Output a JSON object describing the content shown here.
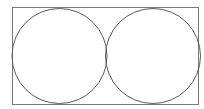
{
  "diagram": {
    "rect": {
      "x": 12.5,
      "y": 7.5,
      "width": 186,
      "height": 97,
      "stroke": "#7a7a7a"
    },
    "circles": [
      {
        "cx": 59.5,
        "cy": 56,
        "r": 47.5,
        "stroke": "#5a5a5a"
      },
      {
        "cx": 153,
        "cy": 56,
        "r": 47.5,
        "stroke": "#5a5a5a"
      }
    ]
  }
}
